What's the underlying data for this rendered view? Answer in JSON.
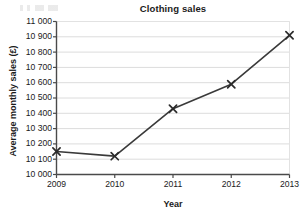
{
  "chart_data": {
    "type": "line",
    "title": "Clothing sales",
    "xlabel": "Year",
    "ylabel": "Average monthly sales (£)",
    "categories": [
      "2009",
      "2010",
      "2011",
      "2012",
      "2013"
    ],
    "x": [
      2009,
      2010,
      2011,
      2012,
      2013
    ],
    "values": [
      10150,
      10120,
      10430,
      10590,
      10910
    ],
    "series": [
      {
        "name": "Average monthly sales",
        "values": [
          10150,
          10120,
          10430,
          10590,
          10910
        ]
      }
    ],
    "xlim": [
      2009,
      2013
    ],
    "ylim": [
      10000,
      11000
    ],
    "ytick_step": 100,
    "ytick_labels": [
      "10 000",
      "10 100",
      "10 200",
      "10 300",
      "10 400",
      "10 500",
      "10 600",
      "10 700",
      "10 800",
      "10 900",
      "11 000"
    ],
    "ytick_values": [
      10000,
      10100,
      10200,
      10300,
      10400,
      10500,
      10600,
      10700,
      10800,
      10900,
      11000
    ],
    "xtick_labels": [
      "2009",
      "2010",
      "2011",
      "2012",
      "2013"
    ],
    "grid": "horizontal",
    "legend": "none",
    "marker": "x-cross",
    "colors": {
      "line": "#3a3a3a",
      "marker": "#2b2b2b",
      "gridline": "#dcdcdc",
      "axis": "#4a4a4a",
      "plot_border": "#e2e2e2",
      "background": "#ffffff",
      "text": "#1b1b1b"
    }
  }
}
